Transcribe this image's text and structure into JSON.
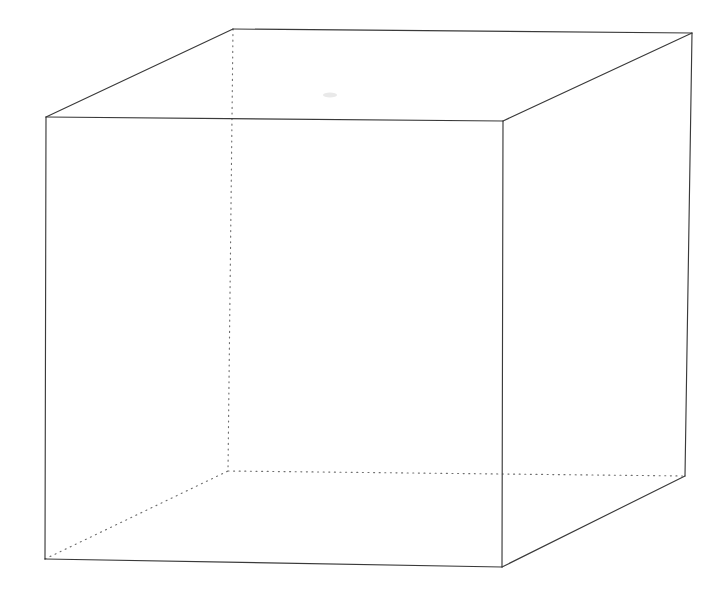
{
  "canvas": {
    "width": 726,
    "height": 596,
    "background": "#ffffff",
    "title": "Wireframe Cube"
  },
  "style": {
    "visible_edge_color": "#3a3a3a",
    "hidden_edge_color": "#6f6f6f",
    "visible_edge_width": 1.15,
    "hidden_edge_width": 1.15,
    "hidden_edge_pattern": "dotted",
    "hidden_edge_dasharray": "1 4.6",
    "face_fill": "none"
  },
  "chart_data": {
    "type": "diagram",
    "subtype": "wireframe-cube",
    "projection": "oblique-perspective",
    "vertices": {
      "front_top_left": {
        "x": 46,
        "y": 117
      },
      "front_top_right": {
        "x": 503,
        "y": 121
      },
      "front_bottom_right": {
        "x": 502,
        "y": 567
      },
      "front_bottom_left": {
        "x": 45,
        "y": 559
      },
      "back_top_left": {
        "x": 233,
        "y": 29
      },
      "back_top_right": {
        "x": 692,
        "y": 33
      },
      "back_bottom_right": {
        "x": 685,
        "y": 476
      },
      "back_bottom_left": {
        "x": 228,
        "y": 471
      }
    },
    "edges": [
      {
        "id": "front-top",
        "from": "front_top_left",
        "to": "front_top_right",
        "visible": true
      },
      {
        "id": "front-right",
        "from": "front_top_right",
        "to": "front_bottom_right",
        "visible": true
      },
      {
        "id": "front-bottom",
        "from": "front_bottom_right",
        "to": "front_bottom_left",
        "visible": true
      },
      {
        "id": "front-left",
        "from": "front_bottom_left",
        "to": "front_top_left",
        "visible": true
      },
      {
        "id": "top-back",
        "from": "back_top_left",
        "to": "back_top_right",
        "visible": true
      },
      {
        "id": "back-right",
        "from": "back_top_right",
        "to": "back_bottom_right",
        "visible": true
      },
      {
        "id": "connect-top-left",
        "from": "front_top_left",
        "to": "back_top_left",
        "visible": true
      },
      {
        "id": "connect-top-right",
        "from": "front_top_right",
        "to": "back_top_right",
        "visible": true
      },
      {
        "id": "connect-bottom-right",
        "from": "front_bottom_right",
        "to": "back_bottom_right",
        "visible": true
      },
      {
        "id": "hidden-back-left-vertical",
        "from": "back_top_left",
        "to": "back_bottom_left",
        "visible": false
      },
      {
        "id": "hidden-back-bottom",
        "from": "back_bottom_left",
        "to": "back_bottom_right",
        "visible": false
      },
      {
        "id": "hidden-connect-bottom-left",
        "from": "front_bottom_left",
        "to": "back_bottom_left",
        "visible": false
      }
    ],
    "faces": [
      {
        "id": "front",
        "vertices": [
          "front_top_left",
          "front_top_right",
          "front_bottom_right",
          "front_bottom_left"
        ],
        "fill": "none"
      },
      {
        "id": "top",
        "vertices": [
          "front_top_left",
          "back_top_left",
          "back_top_right",
          "front_top_right"
        ],
        "fill": "none"
      },
      {
        "id": "right",
        "vertices": [
          "front_top_right",
          "back_top_right",
          "back_bottom_right",
          "front_bottom_right"
        ],
        "fill": "none"
      }
    ],
    "annotations": [
      {
        "id": "faint-smudge",
        "x": 330,
        "y": 95,
        "rx": 7,
        "ry": 2.5,
        "color": "#e9e9e9"
      }
    ],
    "xlabel": "",
    "ylabel": "",
    "legend": [],
    "grid": false
  }
}
